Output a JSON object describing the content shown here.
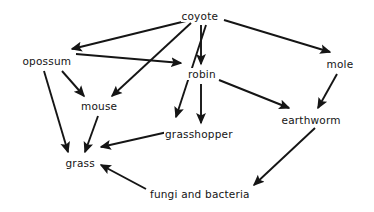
{
  "diagram": {
    "type": "food-web",
    "title": "",
    "background_color": "#ffffff",
    "edge_color": "#151515",
    "label_color": "#151515",
    "nodes": [
      {
        "id": "coyote",
        "label": "coyote",
        "x": 200,
        "y": 16
      },
      {
        "id": "opossum",
        "label": "opossum",
        "x": 47,
        "y": 61
      },
      {
        "id": "robin",
        "label": "robin",
        "x": 202,
        "y": 74
      },
      {
        "id": "mole",
        "label": "mole",
        "x": 340,
        "y": 64
      },
      {
        "id": "mouse",
        "label": "mouse",
        "x": 99,
        "y": 106
      },
      {
        "id": "earthworm",
        "label": "earthworm",
        "x": 311,
        "y": 120
      },
      {
        "id": "grasshopper",
        "label": "grasshopper",
        "x": 199,
        "y": 134
      },
      {
        "id": "grass",
        "label": "grass",
        "x": 80,
        "y": 163
      },
      {
        "id": "fungi_and_bacteria",
        "label": "fungi and bacteria",
        "x": 200,
        "y": 194
      }
    ],
    "edges": [
      {
        "from": "coyote",
        "to": "opossum",
        "x1": 190,
        "y1": 20,
        "x2": 72,
        "y2": 49
      },
      {
        "from": "coyote",
        "to": "mouse",
        "x1": 191,
        "y1": 23,
        "x2": 112,
        "y2": 96
      },
      {
        "from": "coyote",
        "to": "grasshopper",
        "x1": 206,
        "y1": 25,
        "x2": 176,
        "y2": 117
      },
      {
        "from": "coyote",
        "to": "robin",
        "x1": 201,
        "y1": 25,
        "x2": 201,
        "y2": 64
      },
      {
        "from": "coyote",
        "to": "mole",
        "x1": 224,
        "y1": 20,
        "x2": 330,
        "y2": 52
      },
      {
        "from": "opossum",
        "to": "robin",
        "x1": 76,
        "y1": 54,
        "x2": 181,
        "y2": 63
      },
      {
        "from": "opossum",
        "to": "mouse",
        "x1": 62,
        "y1": 71,
        "x2": 84,
        "y2": 96
      },
      {
        "from": "opossum",
        "to": "grass",
        "x1": 44,
        "y1": 71,
        "x2": 68,
        "y2": 152
      },
      {
        "from": "mouse",
        "to": "grass",
        "x1": 98,
        "y1": 116,
        "x2": 85,
        "y2": 152
      },
      {
        "from": "robin",
        "to": "grasshopper",
        "x1": 201,
        "y1": 84,
        "x2": 201,
        "y2": 123
      },
      {
        "from": "robin",
        "to": "earthworm",
        "x1": 219,
        "y1": 80,
        "x2": 289,
        "y2": 108
      },
      {
        "from": "mole",
        "to": "earthworm",
        "x1": 337,
        "y1": 74,
        "x2": 318,
        "y2": 108
      },
      {
        "from": "grasshopper",
        "to": "grass",
        "x1": 172,
        "y1": 131,
        "x2": 101,
        "y2": 147
      },
      {
        "from": "earthworm",
        "to": "fungi_and_bacteria",
        "x1": 315,
        "y1": 128,
        "x2": 254,
        "y2": 185
      },
      {
        "from": "fungi_and_bacteria",
        "to": "grass",
        "x1": 146,
        "y1": 189,
        "x2": 101,
        "y2": 165
      }
    ]
  }
}
